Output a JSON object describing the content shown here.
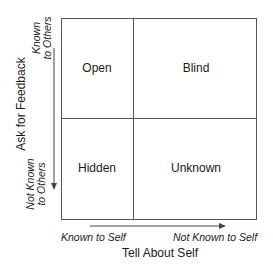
{
  "diagram": {
    "type": "johari-window",
    "quadrants": {
      "top_left": "Open",
      "top_right": "Blind",
      "bottom_left": "Hidden",
      "bottom_right": "Unknown"
    },
    "y_axis": {
      "title": "Ask for Feedback",
      "top_label_line1": "Known",
      "top_label_line2": "to Others",
      "bottom_label_line1": "Not Known",
      "bottom_label_line2": "to Others"
    },
    "x_axis": {
      "title": "Tell About Self",
      "left_label": "Known to Self",
      "right_label": "Not Known to Self"
    },
    "colors": {
      "lines": "#555555",
      "text": "#1a1a1a",
      "background": "#ffffff"
    }
  }
}
